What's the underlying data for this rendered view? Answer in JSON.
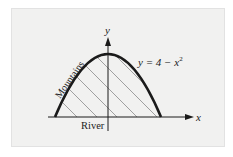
{
  "diagram": {
    "equation_label": "y = 4 − x",
    "equation_exponent": "2",
    "x_axis_label": "x",
    "y_axis_label": "y",
    "curve_label": "Mountains",
    "baseline_label": "River",
    "curve": {
      "function": "y = 4 - x^2",
      "x_range": [
        -2,
        2
      ],
      "y_max": 4
    },
    "colors": {
      "curve": "#1a1a1a",
      "hatch": "#888888",
      "axes": "#1a1a1a",
      "background": "#f1f1f0"
    }
  }
}
